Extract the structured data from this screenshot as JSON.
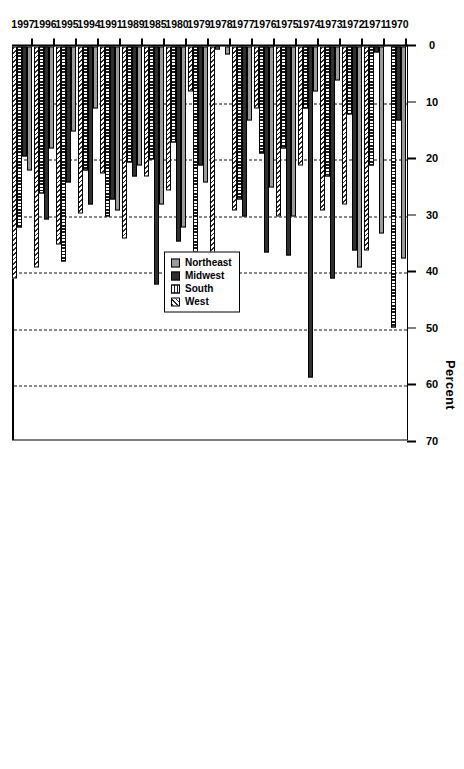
{
  "chart_data": {
    "type": "bar",
    "orientation": "horizontal",
    "title": "Percent",
    "xlabel": "Percent",
    "ylabel": "",
    "xlim": [
      0,
      70
    ],
    "xticks": [
      0,
      10,
      20,
      30,
      40,
      50,
      60,
      70
    ],
    "grid": true,
    "legend_position": "bottom-right",
    "categories": [
      "1970",
      "1971",
      "1972",
      "1973",
      "1974",
      "1975",
      "1976",
      "1977",
      "1978",
      "1979",
      "1980",
      "1985",
      "1989",
      "1991",
      "1994",
      "1995",
      "1996",
      "1997"
    ],
    "series": [
      {
        "name": "Northeast",
        "color": "#9a9a9a",
        "pattern": "solid-grey",
        "values": [
          37.5,
          33.0,
          39.0,
          6.0,
          8.0,
          30.0,
          25.0,
          13.0,
          1.5,
          24.0,
          32.0,
          28.0,
          21.0,
          29.0,
          11.0,
          15.0,
          18.0,
          22.0
        ]
      },
      {
        "name": "Midwest",
        "color": "#2f2f2f",
        "pattern": "dark-dotted",
        "values": [
          13.0,
          1.0,
          36.0,
          41.0,
          58.5,
          37.0,
          36.5,
          30.0,
          0.0,
          21.0,
          34.5,
          42.0,
          23.0,
          27.0,
          28.0,
          24.0,
          30.5,
          19.5
        ]
      },
      {
        "name": "South",
        "color": "#1a1a1a",
        "pattern": "vertical-hatch",
        "values": [
          49.6,
          21.0,
          12.0,
          23.0,
          11.0,
          18.0,
          19.0,
          27.0,
          0.5,
          44.0,
          17.0,
          20.0,
          20.5,
          30.0,
          22.0,
          38.0,
          26.0,
          32.0
        ]
      },
      {
        "name": "West",
        "color": "#ffffff",
        "pattern": "diagonal-hatch",
        "values": [
          0.0,
          36.0,
          28.0,
          29.0,
          21.0,
          30.0,
          11.0,
          29.0,
          40.0,
          8.0,
          25.5,
          23.0,
          34.0,
          22.5,
          29.5,
          35.0,
          39.0,
          41.0
        ]
      }
    ]
  },
  "legend": {
    "items": [
      {
        "label": "Northeast"
      },
      {
        "label": "Midwest"
      },
      {
        "label": "South"
      },
      {
        "label": "West"
      }
    ]
  }
}
